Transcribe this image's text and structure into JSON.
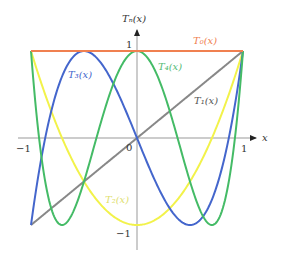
{
  "chart_data": {
    "type": "line",
    "title": "",
    "xlabel": "x",
    "ylabel": "Tₙ(x)",
    "xlim": [
      -1,
      1
    ],
    "ylim": [
      -1,
      1
    ],
    "grid": false,
    "x_ticks": [
      "-1",
      "0",
      "1"
    ],
    "y_ticks": [
      "1",
      "-1"
    ],
    "series": [
      {
        "name": "T₀(x)",
        "formula": "1",
        "color": "#f08050",
        "label_pos": [
          0.72,
          1.1
        ]
      },
      {
        "name": "T₁(x)",
        "formula": "x",
        "color": "#888888",
        "label_pos": [
          0.65,
          0.4
        ]
      },
      {
        "name": "T₂(x)",
        "formula": "2x^2-1",
        "color": "#f2f24a",
        "label_pos": [
          -0.15,
          -0.82
        ]
      },
      {
        "name": "T₃(x)",
        "formula": "4x^3-3x",
        "color": "#4466cc",
        "label_pos": [
          -0.6,
          0.72
        ]
      },
      {
        "name": "T₄(x)",
        "formula": "8x^4-8x^2+1",
        "color": "#44bb66",
        "label_pos": [
          0.2,
          0.8
        ]
      }
    ]
  },
  "labels": {
    "ylabel": "Tₙ(x)",
    "xlabel": "x",
    "tick_x_neg": "−1",
    "tick_x_zero": "0",
    "tick_x_pos": "1",
    "tick_y_pos": "1",
    "tick_y_neg": "−1",
    "t0": "T₀(x)",
    "t1": "T₁(x)",
    "t2": "T₂(x)",
    "t3": "T₃(x)",
    "t4": "T₄(x)"
  }
}
